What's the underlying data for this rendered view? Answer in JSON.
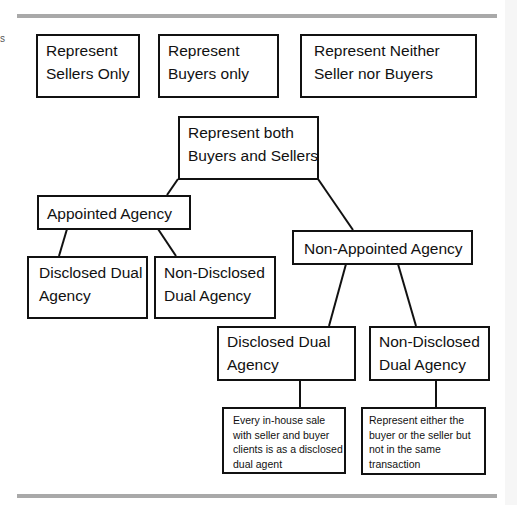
{
  "edge_fragment": "s",
  "top_boxes": [
    {
      "lines": [
        "Represent",
        "Sellers Only"
      ]
    },
    {
      "lines": [
        "Represent",
        "Buyers only"
      ]
    },
    {
      "lines": [
        "Represent Neither",
        "Seller nor Buyers"
      ]
    }
  ],
  "root": {
    "lines": [
      "Represent both",
      "Buyers and Sellers"
    ]
  },
  "appointed": {
    "label": "Appointed Agency",
    "children": [
      {
        "lines": [
          "Disclosed Dual",
          "Agency"
        ]
      },
      {
        "lines": [
          "Non-Disclosed",
          "Dual Agency"
        ]
      }
    ]
  },
  "non_appointed": {
    "label": "Non-Appointed Agency",
    "children": [
      {
        "lines": [
          "Disclosed Dual",
          "Agency"
        ],
        "note": [
          "Every in-house sale",
          "with seller and buyer",
          "clients is as a disclosed",
          "dual agent"
        ]
      },
      {
        "lines": [
          "Non-Disclosed",
          "Dual Agency"
        ],
        "note": [
          "Represent either the",
          "buyer or the seller but",
          "not in the same",
          "transaction"
        ]
      }
    ]
  },
  "colors": {
    "rule": "#a9a9a9",
    "border": "#111111",
    "background": "#ffffff"
  }
}
